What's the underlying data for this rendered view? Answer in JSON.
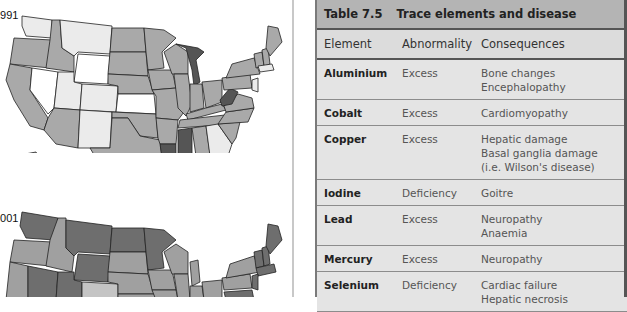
{
  "maps": {
    "top_year_label": "1991",
    "bottom_year_label": "2001"
  },
  "table": {
    "number": "Table 7.5",
    "title": "Trace elements and disease",
    "headers": [
      "Element",
      "Abnormality",
      "Consequences"
    ],
    "rows": [
      {
        "element": "Aluminium",
        "abnormality": "Excess",
        "consequences": [
          "Bone changes",
          "Encephalopathy"
        ]
      },
      {
        "element": "Cobalt",
        "abnormality": "Excess",
        "consequences": [
          "Cardiomyopathy"
        ]
      },
      {
        "element": "Copper",
        "abnormality": "Excess",
        "consequences": [
          "Hepatic damage",
          "Basal ganglia damage",
          "(i.e. Wilson's disease)"
        ]
      },
      {
        "element": "Iodine",
        "abnormality": "Deficiency",
        "consequences": [
          "Goitre"
        ]
      },
      {
        "element": "Lead",
        "abnormality": "Excess",
        "consequences": [
          "Neuropathy",
          "Anaemia"
        ]
      },
      {
        "element": "Mercury",
        "abnormality": "Excess",
        "consequences": [
          "Neuropathy"
        ]
      },
      {
        "element": "Selenium",
        "abnormality": "Deficiency",
        "consequences": [
          "Cardiac failure",
          "Hepatic necrosis"
        ]
      }
    ]
  }
}
